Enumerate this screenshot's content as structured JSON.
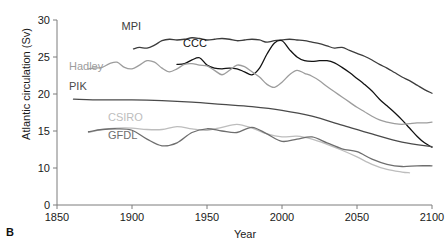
{
  "panel": {
    "letter": "B"
  },
  "chart_data": {
    "type": "line",
    "title": "",
    "xlabel": "Year",
    "ylabel": "Atlantic circulation (Sv)",
    "xlim": [
      1850,
      2100
    ],
    "ylim": [
      0,
      30
    ],
    "grid": false,
    "legend": "inline-labels",
    "xticks": [
      1850,
      1900,
      1950,
      2000,
      2050,
      2100
    ],
    "yticks": [
      0,
      10,
      15,
      20,
      25,
      30
    ],
    "y_axis_break_between": [
      0,
      10
    ],
    "series": [
      {
        "name": "MPI",
        "color": "#3c3c3c",
        "label_x": 1893,
        "label_y": 28.6,
        "x": [
          1901,
          1905,
          1910,
          1915,
          1920,
          1925,
          1930,
          1935,
          1940,
          1945,
          1950,
          1955,
          1960,
          1965,
          1970,
          1975,
          1980,
          1985,
          1990,
          1995,
          2000,
          2005,
          2010,
          2015,
          2020,
          2025,
          2030,
          2035,
          2040,
          2045,
          2050,
          2055,
          2060,
          2065,
          2070,
          2075,
          2080,
          2085,
          2090,
          2095,
          2100
        ],
        "y": [
          26.1,
          26.3,
          26.2,
          26.6,
          27.2,
          27.4,
          27.3,
          27.4,
          27.6,
          27.5,
          27.3,
          27.4,
          27.5,
          27.4,
          27.2,
          27.3,
          27.4,
          27.3,
          27.0,
          27.2,
          27.3,
          27.4,
          27.3,
          27.2,
          27.0,
          26.8,
          26.5,
          26.2,
          26.3,
          25.9,
          25.5,
          25.1,
          24.6,
          24.0,
          23.5,
          22.9,
          22.3,
          21.8,
          21.2,
          20.6,
          20.1
        ]
      },
      {
        "name": "CCC",
        "color": "#121212",
        "label_x": 1934,
        "label_y": 26.3,
        "x": [
          1930,
          1935,
          1940,
          1945,
          1950,
          1955,
          1960,
          1965,
          1970,
          1975,
          1980,
          1985,
          1990,
          1995,
          2000,
          2005,
          2010,
          2015,
          2020,
          2025,
          2030,
          2035,
          2040,
          2045,
          2050,
          2055,
          2060,
          2065,
          2070,
          2075,
          2080,
          2085,
          2090,
          2095,
          2100
        ],
        "y": [
          24.0,
          24.1,
          24.6,
          24.9,
          23.9,
          23.5,
          23.4,
          23.5,
          23.4,
          23.0,
          22.6,
          23.5,
          25.4,
          26.9,
          27.2,
          26.0,
          25.0,
          24.5,
          24.4,
          24.5,
          24.5,
          24.2,
          23.6,
          22.9,
          22.1,
          21.3,
          20.4,
          19.3,
          18.4,
          17.5,
          16.5,
          15.4,
          14.3,
          13.4,
          12.8
        ]
      },
      {
        "name": "Hadley",
        "color": "#9d9d9d",
        "label_x": 1858,
        "label_y": 23.3,
        "x": [
          1871,
          1875,
          1880,
          1885,
          1890,
          1895,
          1900,
          1905,
          1910,
          1915,
          1920,
          1925,
          1930,
          1935,
          1940,
          1945,
          1950,
          1955,
          1960,
          1965,
          1970,
          1975,
          1980,
          1985,
          1990,
          1995,
          2000,
          2005,
          2010,
          2015,
          2020,
          2025,
          2030,
          2035,
          2040,
          2045,
          2050,
          2055,
          2060,
          2065,
          2070,
          2075,
          2080,
          2085,
          2090,
          2095,
          2100
        ],
        "y": [
          23.4,
          23.5,
          23.6,
          24.1,
          24.3,
          23.6,
          23.4,
          23.9,
          24.5,
          24.3,
          23.5,
          23.0,
          23.4,
          24.0,
          24.1,
          23.9,
          23.8,
          23.2,
          22.6,
          23.2,
          23.9,
          23.7,
          23.0,
          22.3,
          21.3,
          20.9,
          21.6,
          22.6,
          23.2,
          22.8,
          22.4,
          21.8,
          21.0,
          20.3,
          19.6,
          18.9,
          18.2,
          17.6,
          17.0,
          16.5,
          16.2,
          16.0,
          15.9,
          16.0,
          16.1,
          16.1,
          16.2
        ]
      },
      {
        "name": "PIK",
        "color": "#4a4a4a",
        "label_x": 1858,
        "label_y": 20.6,
        "x": [
          1861,
          1880,
          1900,
          1920,
          1940,
          1960,
          1980,
          2000,
          2020,
          2040,
          2060,
          2080,
          2100
        ],
        "y": [
          19.3,
          19.2,
          19.2,
          19.1,
          18.9,
          18.6,
          18.3,
          17.8,
          17.0,
          15.8,
          14.6,
          13.5,
          12.9
        ]
      },
      {
        "name": "CSIRO",
        "color": "#bdbdbd",
        "label_x": 1884,
        "label_y": 16.4,
        "x": [
          1871,
          1880,
          1890,
          1900,
          1910,
          1920,
          1930,
          1940,
          1950,
          1960,
          1970,
          1980,
          1990,
          2000,
          2010,
          2020,
          2030,
          2040,
          2050,
          2060,
          2070,
          2080,
          2085
        ],
        "y": [
          14.8,
          15.2,
          15.4,
          15.4,
          15.2,
          15.2,
          15.6,
          15.3,
          15.1,
          15.5,
          15.9,
          15.4,
          14.6,
          14.2,
          14.3,
          13.9,
          13.2,
          12.4,
          11.5,
          10.5,
          9.6,
          8.9,
          8.7
        ]
      },
      {
        "name": "GFDL",
        "color": "#6e6e6e",
        "label_x": 1884,
        "label_y": 13.9,
        "x": [
          1871,
          1880,
          1890,
          1900,
          1910,
          1920,
          1930,
          1940,
          1950,
          1960,
          1970,
          1980,
          1990,
          2000,
          2010,
          2020,
          2030,
          2040,
          2050,
          2060,
          2070,
          2080,
          2090,
          2100
        ],
        "y": [
          14.9,
          15.2,
          15.3,
          15.1,
          13.9,
          13.0,
          13.4,
          14.8,
          15.3,
          15.0,
          14.8,
          15.5,
          14.6,
          13.6,
          13.9,
          14.2,
          13.4,
          12.6,
          12.2,
          11.2,
          10.5,
          10.2,
          10.3,
          10.3
        ]
      }
    ]
  }
}
